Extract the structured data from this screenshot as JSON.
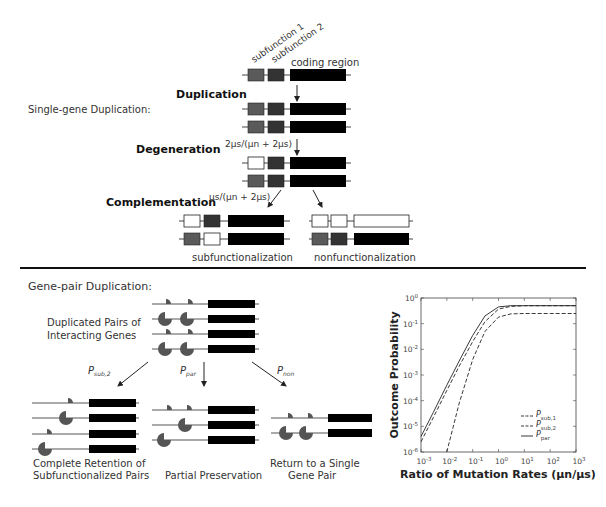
{
  "single_gene": {
    "title": "Single-gene Duplication:",
    "labels": {
      "subfunction_1": "subfunction 1",
      "subfunction_2": "subfunction 2",
      "coding_region": "coding region"
    },
    "steps": {
      "duplication": "Duplication",
      "degeneration": "Degeneration",
      "complementation": "Complementation"
    },
    "rates": {
      "degeneration": "2μs/(μn + 2μs)",
      "complementation": "μs/(μn + 2μs)"
    },
    "outcomes": {
      "left": "subfunctionalization",
      "right": "nonfunctionalization"
    },
    "colors": {
      "subfunction_1": "#5a5a5a",
      "subfunction_2": "#333333",
      "coding": "#000000",
      "lost": "#ffffff"
    }
  },
  "gene_pair": {
    "title": "Gene-pair Duplication:",
    "source_label_line1": "Duplicated Pairs of",
    "source_label_line2": "Interacting Genes",
    "paths": {
      "sub2": {
        "symbol": "P",
        "subscript": "sub,2"
      },
      "par": {
        "symbol": "P",
        "subscript": "par"
      },
      "non": {
        "symbol": "P",
        "subscript": "non"
      }
    },
    "outcomes": {
      "left_line1": "Complete Retention of",
      "left_line2": "Subfunctionalized Pairs",
      "middle": "Partial Preservation",
      "right_line1": "Return to a Single",
      "right_line2": "Gene Pair"
    },
    "colors": {
      "protein": "#555555",
      "line": "#555555",
      "coding": "#000000"
    }
  },
  "chart_data": {
    "type": "line",
    "title": "",
    "xlabel": "Ratio of Mutation Rates (μn/μs)",
    "ylabel": "Outcome Probability",
    "xscale": "log",
    "yscale": "log",
    "xlim": [
      0.001,
      1000
    ],
    "ylim": [
      1e-06,
      1
    ],
    "x_ticks": [
      "10^-3",
      "10^-2",
      "10^-1",
      "10^0",
      "10^1",
      "10^2",
      "10^3"
    ],
    "y_ticks": [
      "10^0",
      "10^-1",
      "10^-2",
      "10^-3",
      "10^-4",
      "10^-5",
      "10^-6"
    ],
    "grid": false,
    "legend_position": "lower right",
    "x": [
      0.001,
      0.003,
      0.01,
      0.03,
      0.1,
      0.3,
      1,
      3,
      10,
      100,
      1000
    ],
    "series": [
      {
        "name": "P_sub,1",
        "style": "dashed",
        "values": [
          2.5e-06,
          2.2e-05,
          0.00025,
          0.0022,
          0.02,
          0.12,
          0.37,
          0.47,
          0.5,
          0.5,
          0.5
        ]
      },
      {
        "name": "P_sub,2",
        "style": "dashed",
        "values": [
          null,
          null,
          1e-06,
          8e-05,
          0.004,
          0.05,
          0.18,
          0.24,
          0.25,
          0.25,
          0.25
        ]
      },
      {
        "name": "P_par",
        "style": "solid",
        "values": [
          4e-06,
          3.5e-05,
          0.0004,
          0.0035,
          0.035,
          0.2,
          0.45,
          0.5,
          0.5,
          0.5,
          0.5
        ]
      }
    ],
    "legend": [
      {
        "symbol": "P",
        "subscript": "sub,1"
      },
      {
        "symbol": "P",
        "subscript": "sub,2"
      },
      {
        "symbol": "P",
        "subscript": "par"
      }
    ]
  }
}
